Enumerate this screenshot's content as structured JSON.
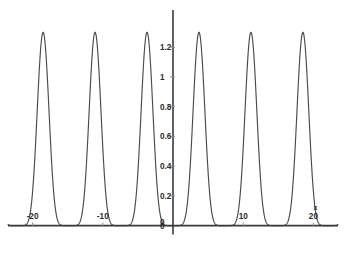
{
  "chart_data": {
    "type": "line",
    "title": "",
    "subtitle": "",
    "xlabel": "x",
    "ylabel": "",
    "xlim": [
      -23.5,
      23.5
    ],
    "ylim": [
      -0.07,
      1.45
    ],
    "grid": false,
    "legend": null,
    "x_ticks": [
      {
        "value": -20,
        "label": "-20"
      },
      {
        "value": -10,
        "label": "-10"
      },
      {
        "value": 10,
        "label": "10"
      },
      {
        "value": 20,
        "label": "20"
      }
    ],
    "y_ticks": [
      {
        "value": 0,
        "label": "0"
      },
      {
        "value": 0.2,
        "label": "0.2"
      },
      {
        "value": 0.4,
        "label": "0.4"
      },
      {
        "value": 0.6,
        "label": "0.6"
      },
      {
        "value": 0.8,
        "label": "0.8"
      },
      {
        "value": 1,
        "label": "1"
      },
      {
        "value": 1.2,
        "label": "1.2"
      }
    ],
    "origin_label": "0",
    "series": [
      {
        "name": "periodic-pulse",
        "color": "#4a4a4a",
        "period": 7.4,
        "peak_value": 1.3,
        "trough_value": 0,
        "peak_x": [
          -18.5,
          -11.1,
          -3.7,
          3.7,
          11.1,
          18.5
        ],
        "peak_count": 6,
        "shape_exponent": 8,
        "points_x": [
          -23.5,
          -22.5,
          -21.5,
          -20.5,
          -19.5,
          -18.5,
          -17.5,
          -16.5,
          -15.5,
          -14.5,
          -13.5,
          -12.5,
          -11.5,
          -11.1,
          -10.5,
          -9.5,
          -8.5,
          -7.5,
          -6.5,
          -5.5,
          -4.5,
          -3.7,
          -3.0,
          -2.0,
          -1.0,
          0.0,
          1.0,
          2.0,
          3.0,
          3.7,
          4.5,
          5.5,
          6.5,
          7.5,
          8.5,
          9.5,
          10.5,
          11.1,
          12.5,
          13.5,
          14.5,
          15.5,
          16.5,
          17.5,
          18.5,
          19.5,
          20.5,
          21.5,
          22.5,
          23.5
        ],
        "points_y": [
          0.25,
          0.02,
          0.0,
          0.08,
          0.85,
          1.3,
          0.85,
          0.08,
          0.0,
          0.01,
          0.12,
          0.62,
          1.22,
          1.3,
          1.08,
          0.25,
          0.0,
          0.0,
          0.04,
          0.45,
          1.12,
          1.3,
          1.12,
          0.45,
          0.04,
          0.0,
          0.04,
          0.45,
          1.12,
          1.3,
          1.12,
          0.45,
          0.0,
          0.0,
          0.25,
          1.08,
          1.22,
          1.3,
          0.62,
          0.12,
          0.01,
          0.0,
          0.08,
          0.85,
          1.3,
          0.85,
          0.08,
          0.0,
          0.02,
          0.25
        ]
      }
    ]
  },
  "figure": {
    "background_color": "#ffffff",
    "axis_color": "#3a3a3a",
    "curve_color": "#4a4a4a",
    "tick_color": "#8d8d8d",
    "label_color": "#2b2b2b"
  }
}
